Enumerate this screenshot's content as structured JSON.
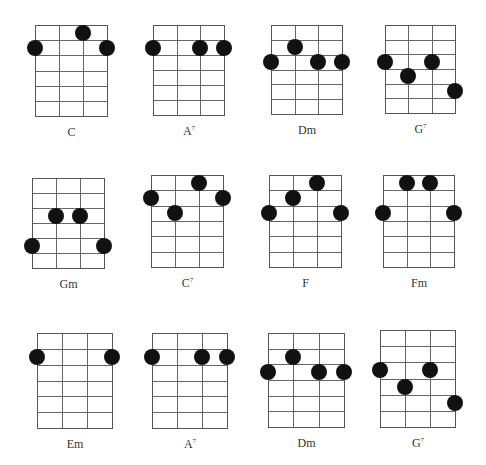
{
  "diagram": {
    "title": "",
    "layout": {
      "rows": 3,
      "cols": 4,
      "strings": 4,
      "frets": 6
    },
    "chords": [
      {
        "name": "C",
        "sup": "",
        "x": 35,
        "y": 25,
        "w": 73,
        "h": 92,
        "dots": [
          {
            "string": 2,
            "fret": 1
          },
          {
            "string": 0,
            "fret": 2
          },
          {
            "string": 3,
            "fret": 2
          }
        ]
      },
      {
        "name": "A",
        "sup": "7",
        "x": 153,
        "y": 25,
        "w": 72,
        "h": 91,
        "dots": [
          {
            "string": 0,
            "fret": 2
          },
          {
            "string": 2,
            "fret": 2
          },
          {
            "string": 3,
            "fret": 2
          }
        ]
      },
      {
        "name": "Dm",
        "sup": "",
        "x": 271,
        "y": 25,
        "w": 72,
        "h": 90,
        "dots": [
          {
            "string": 1,
            "fret": 2
          },
          {
            "string": 0,
            "fret": 3
          },
          {
            "string": 2,
            "fret": 3
          },
          {
            "string": 3,
            "fret": 3
          }
        ]
      },
      {
        "name": "G",
        "sup": "7",
        "x": 385,
        "y": 25,
        "w": 71,
        "h": 89,
        "dots": [
          {
            "string": 0,
            "fret": 3
          },
          {
            "string": 2,
            "fret": 3
          },
          {
            "string": 1,
            "fret": 4
          },
          {
            "string": 3,
            "fret": 5
          }
        ]
      },
      {
        "name": "Gm",
        "sup": "",
        "x": 32,
        "y": 178,
        "w": 73,
        "h": 91,
        "dots": [
          {
            "string": 1,
            "fret": 3
          },
          {
            "string": 2,
            "fret": 3
          },
          {
            "string": 0,
            "fret": 5
          },
          {
            "string": 3,
            "fret": 5
          }
        ]
      },
      {
        "name": "C",
        "sup": "7",
        "x": 151,
        "y": 175,
        "w": 73,
        "h": 93,
        "dots": [
          {
            "string": 2,
            "fret": 1
          },
          {
            "string": 0,
            "fret": 2
          },
          {
            "string": 3,
            "fret": 2
          },
          {
            "string": 1,
            "fret": 3
          }
        ]
      },
      {
        "name": "F",
        "sup": "",
        "x": 269,
        "y": 175,
        "w": 73,
        "h": 93,
        "dots": [
          {
            "string": 2,
            "fret": 1
          },
          {
            "string": 1,
            "fret": 2
          },
          {
            "string": 0,
            "fret": 3
          },
          {
            "string": 3,
            "fret": 3
          }
        ]
      },
      {
        "name": "Fm",
        "sup": "",
        "x": 383,
        "y": 175,
        "w": 72,
        "h": 93,
        "dots": [
          {
            "string": 1,
            "fret": 1
          },
          {
            "string": 2,
            "fret": 1
          },
          {
            "string": 0,
            "fret": 3
          },
          {
            "string": 3,
            "fret": 3
          }
        ]
      },
      {
        "name": "Em",
        "sup": "",
        "x": 37,
        "y": 333,
        "w": 76,
        "h": 96,
        "dots": [
          {
            "string": 0,
            "fret": 2
          },
          {
            "string": 3,
            "fret": 2
          }
        ]
      },
      {
        "name": "A",
        "sup": "7",
        "x": 152,
        "y": 333,
        "w": 76,
        "h": 96,
        "dots": [
          {
            "string": 0,
            "fret": 2
          },
          {
            "string": 2,
            "fret": 2
          },
          {
            "string": 3,
            "fret": 2
          }
        ]
      },
      {
        "name": "Dm",
        "sup": "",
        "x": 268,
        "y": 333,
        "w": 77,
        "h": 95,
        "dots": [
          {
            "string": 1,
            "fret": 2
          },
          {
            "string": 0,
            "fret": 3
          },
          {
            "string": 2,
            "fret": 3
          },
          {
            "string": 3,
            "fret": 3
          }
        ]
      },
      {
        "name": "G",
        "sup": "7",
        "x": 380,
        "y": 330,
        "w": 76,
        "h": 98,
        "dots": [
          {
            "string": 0,
            "fret": 3
          },
          {
            "string": 2,
            "fret": 3
          },
          {
            "string": 1,
            "fret": 4
          },
          {
            "string": 3,
            "fret": 5
          }
        ]
      }
    ]
  },
  "colors": {
    "line": "#666666",
    "dot": "#111111",
    "label": "#333333",
    "background": "#ffffff"
  }
}
